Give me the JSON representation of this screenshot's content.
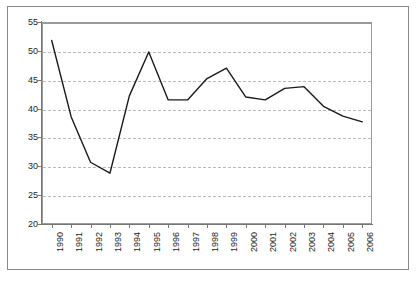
{
  "chart_data": {
    "type": "line",
    "title": "",
    "subtitle": "",
    "xlabel": "",
    "ylabel": "",
    "categories": [
      "1990",
      "1991",
      "1992",
      "1993",
      "1994",
      "1995",
      "1996",
      "1997",
      "1998",
      "1999",
      "2000",
      "2001",
      "2002",
      "2003",
      "2004",
      "2005",
      "2006"
    ],
    "values": [
      51.8,
      38.6,
      30.7,
      28.8,
      42.2,
      49.8,
      41.5,
      41.5,
      45.2,
      47.0,
      42.0,
      41.5,
      43.5,
      43.8,
      40.4,
      38.7,
      37.7
    ],
    "series": [
      {
        "name": "",
        "values": [
          51.8,
          38.6,
          30.7,
          28.8,
          42.2,
          49.8,
          41.5,
          41.5,
          45.2,
          47.0,
          42.0,
          41.5,
          43.5,
          43.8,
          40.4,
          38.7,
          37.7
        ]
      }
    ],
    "ylim": [
      20,
      55
    ],
    "ytick_labels": [
      "20",
      "25",
      "30",
      "35",
      "40",
      "45",
      "50",
      "55"
    ],
    "ytick_values": [
      20,
      25,
      30,
      35,
      40,
      45,
      50,
      55
    ],
    "xtick_labels": [
      "1990",
      "1991",
      "1992",
      "1993",
      "1994",
      "1995",
      "1996",
      "1997",
      "1998",
      "1999",
      "2000",
      "2001",
      "2002",
      "2003",
      "2004",
      "2005",
      "2006"
    ],
    "grid": true,
    "grid_axis": "y",
    "grid_style": "dashed",
    "legend": false,
    "legend_position": "none",
    "xtick_rotation": 90,
    "colors": {
      "series_line": "#1a1a1a",
      "gridline": "#b9b9b9",
      "axis": "#777777",
      "plot_border": "#9a9a9a",
      "outer_frame": "#8a8a8a",
      "background": "#ffffff",
      "tick_text": "#1d1d1d"
    }
  }
}
